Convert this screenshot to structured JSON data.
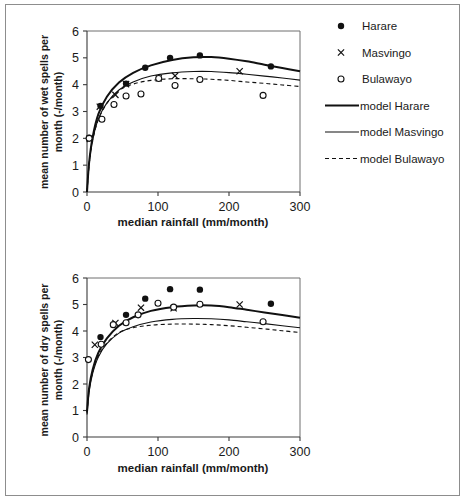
{
  "page": {
    "background_color": "#ffffff",
    "frame_color": "#8d8d8d",
    "ink_color": "#111111"
  },
  "legend": {
    "items": [
      {
        "label": "Harare",
        "marker": "filled-circle-marker"
      },
      {
        "label": "Masvingo",
        "marker": "cross-marker"
      },
      {
        "label": "Bulawayo",
        "marker": "open-circle-marker"
      },
      {
        "label": "model Harare",
        "marker": "thick-solid-line-swatch"
      },
      {
        "label": "model Masvingo",
        "marker": "thin-solid-line-swatch"
      },
      {
        "label": "model Bulawayo",
        "marker": "dashed-line-swatch"
      }
    ]
  },
  "chart_data": [
    {
      "id": "wet-spells-chart",
      "type": "scatter",
      "title": "",
      "xlabel": "median rainfall (mm/month)",
      "ylabel": "mean number of wet spells per month (-/month)",
      "xlim": [
        0,
        300
      ],
      "ylim": [
        0,
        6
      ],
      "xticks": [
        0,
        100,
        200,
        300
      ],
      "yticks": [
        0,
        1,
        2,
        3,
        4,
        5,
        6
      ],
      "grid": false,
      "legend_position": "right",
      "series": [
        {
          "name": "Harare",
          "marker": "filled-circle-marker",
          "points": [
            [
              3,
              2.02
            ],
            [
              19,
              3.21
            ],
            [
              55,
              4.04
            ],
            [
              82,
              4.63
            ],
            [
              117,
              5.0
            ],
            [
              159,
              5.09
            ],
            [
              259,
              4.68
            ]
          ]
        },
        {
          "name": "Masvingo",
          "marker": "cross-marker",
          "points": [
            [
              4,
              1.98
            ],
            [
              18,
              3.18
            ],
            [
              40,
              3.62
            ],
            [
              55,
              4.02
            ],
            [
              101,
              4.24
            ],
            [
              124,
              4.33
            ],
            [
              215,
              4.5
            ]
          ]
        },
        {
          "name": "Bulawayo",
          "marker": "open-circle-marker",
          "points": [
            [
              3,
              2.0
            ],
            [
              21,
              2.71
            ],
            [
              38,
              3.26
            ],
            [
              55,
              3.58
            ],
            [
              76,
              3.65
            ],
            [
              101,
              4.23
            ],
            [
              124,
              3.97
            ],
            [
              159,
              4.19
            ],
            [
              248,
              3.6
            ]
          ]
        }
      ],
      "model_curves": [
        {
          "name": "model Harare",
          "style": "thick-solid",
          "points": [
            [
              0,
              0.0
            ],
            [
              3,
              1.1
            ],
            [
              8,
              2.05
            ],
            [
              16,
              2.9
            ],
            [
              28,
              3.55
            ],
            [
              45,
              4.08
            ],
            [
              65,
              4.44
            ],
            [
              90,
              4.72
            ],
            [
              120,
              4.92
            ],
            [
              150,
              5.02
            ],
            [
              175,
              5.03
            ],
            [
              200,
              4.97
            ],
            [
              225,
              4.87
            ],
            [
              250,
              4.74
            ],
            [
              275,
              4.62
            ],
            [
              300,
              4.5
            ]
          ]
        },
        {
          "name": "model Masvingo",
          "style": "thin-solid",
          "points": [
            [
              0,
              0.0
            ],
            [
              3,
              1.05
            ],
            [
              8,
              1.95
            ],
            [
              16,
              2.72
            ],
            [
              28,
              3.32
            ],
            [
              45,
              3.8
            ],
            [
              65,
              4.1
            ],
            [
              90,
              4.32
            ],
            [
              120,
              4.44
            ],
            [
              150,
              4.49
            ],
            [
              175,
              4.49
            ],
            [
              200,
              4.45
            ],
            [
              225,
              4.39
            ],
            [
              250,
              4.32
            ],
            [
              275,
              4.25
            ],
            [
              300,
              4.17
            ]
          ]
        },
        {
          "name": "model Bulawayo",
          "style": "dashed",
          "points": [
            [
              0,
              0.0
            ],
            [
              3,
              1.02
            ],
            [
              8,
              1.92
            ],
            [
              16,
              2.7
            ],
            [
              28,
              3.3
            ],
            [
              45,
              3.78
            ],
            [
              65,
              4.02
            ],
            [
              90,
              4.16
            ],
            [
              120,
              4.22
            ],
            [
              150,
              4.22
            ],
            [
              175,
              4.2
            ],
            [
              200,
              4.16
            ],
            [
              225,
              4.1
            ],
            [
              250,
              4.05
            ],
            [
              275,
              3.99
            ],
            [
              300,
              3.93
            ]
          ]
        }
      ]
    },
    {
      "id": "dry-spells-chart",
      "type": "scatter",
      "title": "",
      "xlabel": "median rainfall (mm/month)",
      "ylabel": "mean number of dry spells per month (-/month)",
      "xlim": [
        0,
        300
      ],
      "ylim": [
        0,
        6
      ],
      "xticks": [
        0,
        100,
        200,
        300
      ],
      "yticks": [
        0,
        1,
        2,
        3,
        4,
        5,
        6
      ],
      "grid": false,
      "legend_position": "none",
      "series": [
        {
          "name": "Harare",
          "marker": "filled-circle-marker",
          "points": [
            [
              19,
              3.77
            ],
            [
              55,
              4.61
            ],
            [
              82,
              5.22
            ],
            [
              117,
              5.58
            ],
            [
              159,
              5.56
            ],
            [
              259,
              5.03
            ]
          ]
        },
        {
          "name": "Masvingo",
          "marker": "cross-marker",
          "points": [
            [
              11,
              3.48
            ],
            [
              40,
              4.3
            ],
            [
              76,
              4.88
            ],
            [
              122,
              4.86
            ],
            [
              215,
              5.0
            ]
          ]
        },
        {
          "name": "Bulawayo",
          "marker": "open-circle-marker",
          "points": [
            [
              2,
              2.92
            ],
            [
              20,
              3.5
            ],
            [
              37,
              4.24
            ],
            [
              55,
              4.31
            ],
            [
              72,
              4.61
            ],
            [
              100,
              5.05
            ],
            [
              122,
              4.9
            ],
            [
              159,
              5.01
            ],
            [
              248,
              4.35
            ]
          ]
        }
      ],
      "model_curves": [
        {
          "name": "model Harare",
          "style": "thick-solid",
          "points": [
            [
              0,
              0.95
            ],
            [
              3,
              1.85
            ],
            [
              8,
              2.55
            ],
            [
              16,
              3.18
            ],
            [
              28,
              3.72
            ],
            [
              45,
              4.2
            ],
            [
              65,
              4.52
            ],
            [
              90,
              4.76
            ],
            [
              120,
              4.9
            ],
            [
              150,
              4.96
            ],
            [
              175,
              4.96
            ],
            [
              200,
              4.9
            ],
            [
              225,
              4.8
            ],
            [
              250,
              4.7
            ],
            [
              275,
              4.6
            ],
            [
              300,
              4.5
            ]
          ]
        },
        {
          "name": "model Masvingo",
          "style": "thin-solid",
          "points": [
            [
              0,
              0.85
            ],
            [
              3,
              1.7
            ],
            [
              8,
              2.4
            ],
            [
              16,
              3.02
            ],
            [
              28,
              3.52
            ],
            [
              45,
              3.92
            ],
            [
              65,
              4.16
            ],
            [
              90,
              4.34
            ],
            [
              120,
              4.44
            ],
            [
              150,
              4.47
            ],
            [
              175,
              4.46
            ],
            [
              200,
              4.42
            ],
            [
              225,
              4.35
            ],
            [
              250,
              4.28
            ],
            [
              275,
              4.2
            ],
            [
              300,
              4.12
            ]
          ]
        },
        {
          "name": "model Bulawayo",
          "style": "dashed",
          "points": [
            [
              0,
              0.9
            ],
            [
              3,
              1.78
            ],
            [
              8,
              2.46
            ],
            [
              16,
              3.06
            ],
            [
              28,
              3.55
            ],
            [
              45,
              3.94
            ],
            [
              65,
              4.12
            ],
            [
              90,
              4.22
            ],
            [
              120,
              4.26
            ],
            [
              150,
              4.26
            ],
            [
              175,
              4.24
            ],
            [
              200,
              4.2
            ],
            [
              225,
              4.14
            ],
            [
              250,
              4.08
            ],
            [
              275,
              4.01
            ],
            [
              300,
              3.94
            ]
          ]
        }
      ]
    }
  ]
}
